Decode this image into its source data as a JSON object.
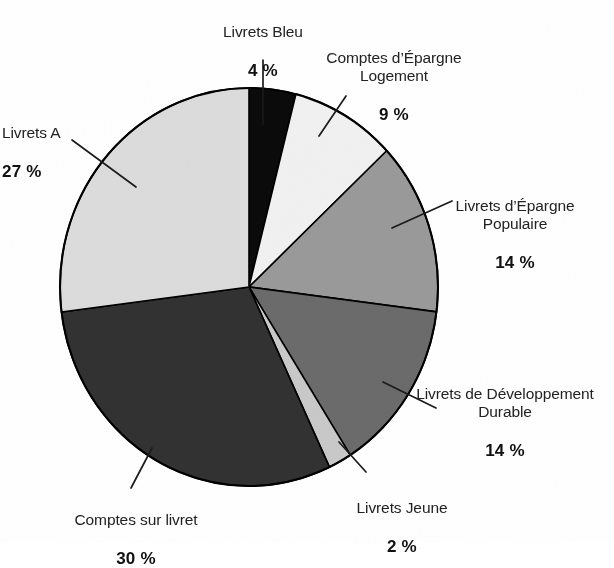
{
  "chart_data": {
    "type": "pie",
    "title": "",
    "subtitle": "",
    "xlabel": "",
    "ylabel": "",
    "legend_position": "callout-labels",
    "grid": false,
    "units": "%",
    "total": 100,
    "start_angle_deg": 0,
    "direction": "clockwise",
    "categories": [
      "Livrets Bleu",
      "Comptes d’Épargne Logement",
      "Livrets d’Épargne Populaire",
      "Livrets de Développement Durable",
      "Livrets Jeune",
      "Comptes sur livret",
      "Livrets A"
    ],
    "values": [
      4,
      9,
      14,
      14,
      2,
      30,
      27
    ],
    "value_labels": [
      "4 %",
      "9 %",
      "14 %",
      "14 %",
      "2 %",
      "30 %",
      "27 %"
    ],
    "colors": [
      "#0b0b0b",
      "#f1f1f1",
      "#9a9a9a",
      "#6b6b6b",
      "#c9c9c9",
      "#323232",
      "#dcdcdc"
    ],
    "slices": [
      {
        "label": "Livrets Bleu",
        "value": 4,
        "value_label": "4 %",
        "color": "#0b0b0b"
      },
      {
        "label": "Comptes d’Épargne Logement",
        "value": 9,
        "value_label": "9 %",
        "color": "#f1f1f1"
      },
      {
        "label": "Livrets d’Épargne Populaire",
        "value": 14,
        "value_label": "14 %",
        "color": "#9a9a9a"
      },
      {
        "label": "Livrets de Développement Durable",
        "value": 14,
        "value_label": "14 %",
        "color": "#6b6b6b"
      },
      {
        "label": "Livrets Jeune",
        "value": 2,
        "value_label": "2 %",
        "color": "#c9c9c9"
      },
      {
        "label": "Comptes sur livret",
        "value": 30,
        "value_label": "30 %",
        "color": "#323232"
      },
      {
        "label": "Livrets A",
        "value": 27,
        "value_label": "27 %",
        "color": "#dcdcdc"
      }
    ]
  },
  "labels": {
    "livrets_bleu": {
      "name": "Livrets Bleu",
      "pct": "4 %"
    },
    "cel": {
      "name": "Comptes d’Épargne\nLogement",
      "pct": "9 %"
    },
    "lep": {
      "name": "Livrets d’Épargne\nPopulaire",
      "pct": "14 %"
    },
    "ldd": {
      "name": "Livrets de Développement\nDurable",
      "pct": "14 %"
    },
    "livrets_jeune": {
      "name": "Livrets Jeune",
      "pct": "2 %"
    },
    "comptes_livret": {
      "name": "Comptes sur livret",
      "pct": "30 %"
    },
    "livrets_a": {
      "name": "Livrets A",
      "pct": "27 %"
    }
  },
  "style": {
    "background": "#ffffff",
    "outline": "#000000",
    "text": "#1a1a1a"
  }
}
